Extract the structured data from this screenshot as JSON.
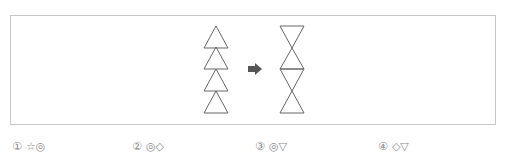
{
  "question": {
    "figure": {
      "left_stack": {
        "description": "four upright triangles stacked vertically",
        "count": 4
      },
      "arrow": {
        "icon": "right-arrow-icon",
        "color": "#555555"
      },
      "right_stack": {
        "description": "alternating inverted and upright triangles forming hourglass chain",
        "count": 4
      },
      "stroke_color": "#666666",
      "border_color": "#c8c8c8"
    }
  },
  "options": [
    {
      "number": "①",
      "symbols": "☆◎"
    },
    {
      "number": "②",
      "symbols": "◎◇"
    },
    {
      "number": "③",
      "symbols": "◎▽"
    },
    {
      "number": "④",
      "symbols": "◇▽"
    }
  ]
}
